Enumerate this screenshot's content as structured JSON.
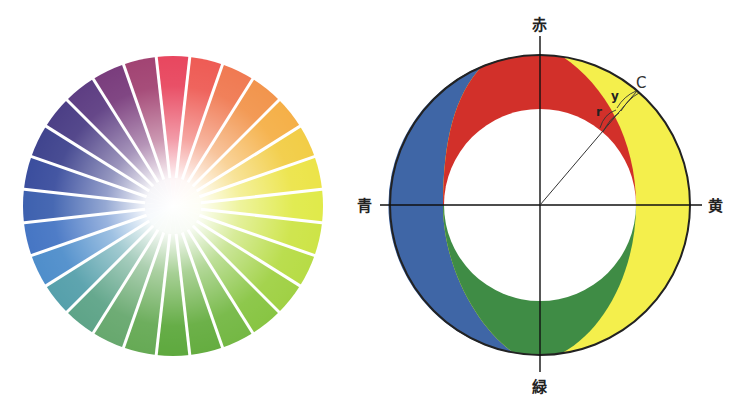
{
  "color_wheel": {
    "center": [
      173,
      206
    ],
    "radius": 150,
    "inner_white_radius": 28,
    "gap_color": "#ffffff",
    "segments": [
      "#e8475f",
      "#ee5c55",
      "#f07a52",
      "#f2954d",
      "#f5b048",
      "#f2cd46",
      "#ece449",
      "#e0ea4a",
      "#cde447",
      "#b7dc46",
      "#a0d145",
      "#88c543",
      "#74b844",
      "#65ad40",
      "#5ea93e",
      "#66aa55",
      "#67a86e",
      "#5ea488",
      "#56a0ab",
      "#4f8ecb",
      "#4676c4",
      "#3e61af",
      "#3b4e9e",
      "#40448e",
      "#4c3f86",
      "#5e3e83",
      "#7a3d7d",
      "#a24473"
    ]
  },
  "diagram": {
    "center": [
      540,
      205
    ],
    "outer_radius": 150,
    "inner_radius": 96,
    "colors": {
      "blue": "#3f66a6",
      "red": "#d2302a",
      "yellow": "#f4ef4c",
      "green": "#3f8c45",
      "outline": "#222222",
      "axis": "#111111"
    },
    "labels": {
      "top": "赤",
      "bottom": "緑",
      "right": "黄",
      "left": "青",
      "point_c": "C",
      "arc_y": "y",
      "arc_r": "r"
    }
  }
}
